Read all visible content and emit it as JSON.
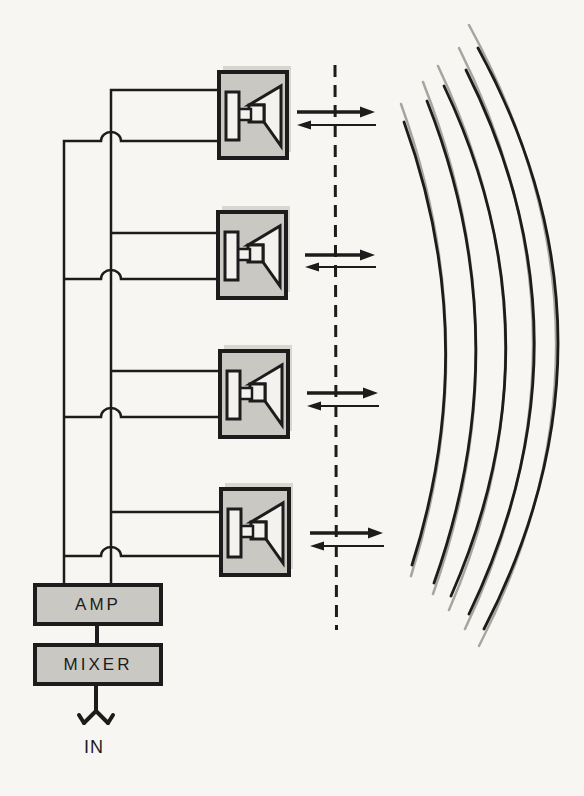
{
  "diagram": {
    "amp_label": "AMP",
    "mixer_label": "MIXER",
    "input_label": "IN",
    "transducer_count": 4,
    "arrow_pair_count": 4,
    "wavefront_arc_count": 5,
    "beam_axis_style": "dashed",
    "colors": {
      "paper": "#f8f6f2",
      "ink": "#1c1c1c",
      "box_fill": "#cac8c3",
      "box_shadow": "#d9d6d0",
      "inner_fill": "#f4f2ee",
      "wavefront_gray": "#a8a59f"
    }
  }
}
